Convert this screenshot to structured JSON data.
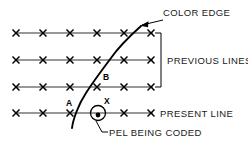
{
  "diagram": {
    "type": "technical-line-diagram",
    "canvas": {
      "width": 248,
      "height": 142,
      "background": "#ffffff"
    },
    "annotations": {
      "color_edge": "COLOR EDGE",
      "previous_lines": "PREVIOUS LINES",
      "present_line": "PRESENT LINE",
      "pel_being_coded": "PEL BEING CODED"
    },
    "point_labels": {
      "a": "A",
      "b": "B",
      "x": "X"
    },
    "colors": {
      "ink": "#000000",
      "line": "#333333",
      "background": "#ffffff"
    },
    "scan_lines": [
      {
        "name": "previous-line-1",
        "y": 33,
        "x_start": 14,
        "x_end": 155,
        "marker_count": 6,
        "marker_spacing": 27
      },
      {
        "name": "previous-line-2",
        "y": 60,
        "x_start": 14,
        "x_end": 155,
        "marker_count": 6,
        "marker_spacing": 27
      },
      {
        "name": "previous-line-3",
        "y": 87,
        "x_start": 14,
        "x_end": 155,
        "marker_count": 6,
        "marker_spacing": 27
      },
      {
        "name": "present-line",
        "y": 113,
        "x_start": 14,
        "x_end": 155,
        "marker_count": 6,
        "marker_spacing": 27
      }
    ],
    "marker_x_positions": [
      16,
      43,
      70,
      97,
      124,
      151
    ],
    "edge_curve": {
      "name": "color-edge",
      "description": "S-shaped boundary between two color regions crossing the scan lines",
      "path": "M 72 128 C 73 120 78 104 86 92 C 93 81 102 70 111 58 C 120 46 130 36 141 27"
    },
    "coded_pel": {
      "name": "pel-being-coded",
      "cx": 98,
      "cy": 113,
      "radius": 7.5,
      "dot_radius": 2.2
    },
    "bracket": {
      "name": "previous-lines-bracket",
      "x": 160,
      "y_top": 33,
      "y_bottom": 87,
      "tick": 5
    }
  }
}
